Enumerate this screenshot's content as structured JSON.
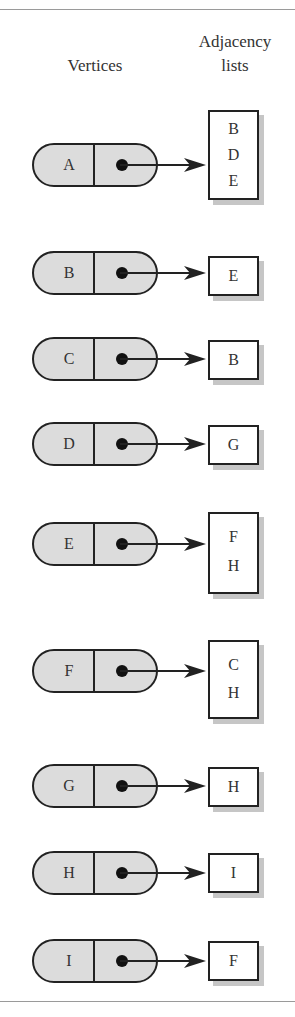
{
  "headings": {
    "vertices": "Vertices",
    "adjacency_line1": "Adjacency",
    "adjacency_line2": "lists"
  },
  "colors": {
    "node_fill": "#dcdcdc",
    "stroke": "#222222",
    "shadow": "#c6c6c6",
    "rule": "#9a9a9a"
  },
  "vertices": [
    {
      "label": "A",
      "adjacency": [
        "B",
        "D",
        "E"
      ]
    },
    {
      "label": "B",
      "adjacency": [
        "E"
      ]
    },
    {
      "label": "C",
      "adjacency": [
        "B"
      ]
    },
    {
      "label": "D",
      "adjacency": [
        "G"
      ]
    },
    {
      "label": "E",
      "adjacency": [
        "F",
        "H"
      ]
    },
    {
      "label": "F",
      "adjacency": [
        "C",
        "H"
      ]
    },
    {
      "label": "G",
      "adjacency": [
        "H"
      ]
    },
    {
      "label": "H",
      "adjacency": [
        "I"
      ]
    },
    {
      "label": "I",
      "adjacency": [
        "F"
      ]
    }
  ]
}
